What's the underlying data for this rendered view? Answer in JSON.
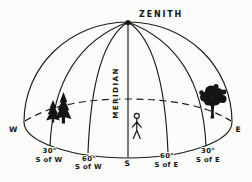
{
  "diagram": {
    "zenith_label": "ZENITH",
    "meridian_label": "MERIDIAN",
    "compass": {
      "west": "W",
      "south": "S",
      "east": "E"
    },
    "bearings": [
      {
        "degrees": "30°",
        "direction": "S of W"
      },
      {
        "degrees": "60°",
        "direction": "S of W"
      },
      {
        "degrees": "60°",
        "direction": "S of E"
      },
      {
        "degrees": "30°",
        "direction": "S of E"
      }
    ],
    "icons": {
      "zenith_marker": "zenith-dot",
      "west_vegetation": "pine-tree-icon",
      "east_vegetation": "deciduous-tree-icon",
      "observer": "person-figure-icon"
    },
    "colors": {
      "ink": "#1c1c1c",
      "background": "#fbfbf9"
    }
  }
}
